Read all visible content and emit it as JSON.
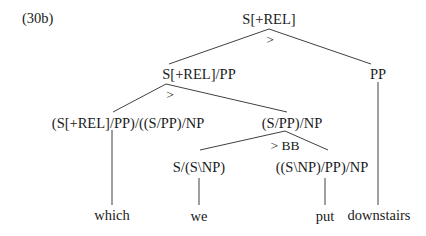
{
  "example_label": "(30b)",
  "tree": {
    "root": {
      "label": "S[+REL]",
      "rule": ">"
    },
    "n1": {
      "label": "S[+REL]/PP",
      "rule": ">"
    },
    "n2": {
      "label": "PP"
    },
    "n3": {
      "label": "(S[+REL]/PP)/((S/PP)/NP"
    },
    "n4": {
      "label": "(S/PP)/NP",
      "rule": "> BB"
    },
    "n5": {
      "label": "S/(S\\NP)"
    },
    "n6": {
      "label": "((S\\NP)/PP)/NP"
    },
    "leaves": [
      "which",
      "we",
      "put",
      "downstairs"
    ]
  },
  "colors": {
    "line": "#2a2a2a",
    "text": "#1a1a1a",
    "background": "#ffffff"
  }
}
